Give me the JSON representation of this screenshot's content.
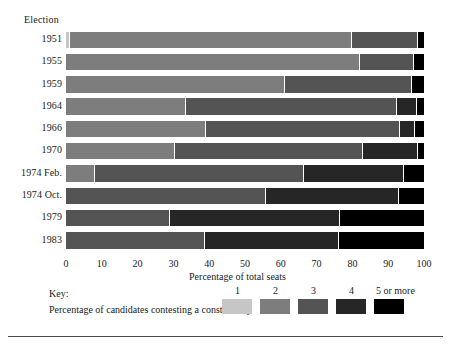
{
  "page": {
    "top_cut_text": "",
    "bottom_rule": true
  },
  "chart_data": {
    "type": "bar",
    "orientation": "horizontal",
    "stacked": true,
    "stack_mode": "percent",
    "title": "",
    "ylabel": "Election",
    "xlabel": "Percentage of total seats",
    "xlim": [
      0,
      100
    ],
    "xticks": [
      0,
      10,
      20,
      30,
      40,
      50,
      60,
      70,
      80,
      90,
      100
    ],
    "xtick_labels": [
      "0",
      "10",
      "20",
      "30",
      "40",
      "50",
      "60",
      "70",
      "80",
      "90",
      "100"
    ],
    "grid": false,
    "legend": {
      "title": "Key:",
      "subtitle": "Percentage of candidates contesting a constituency",
      "position": "bottom",
      "entries": [
        {
          "label": "1",
          "color": "#c6c6c6"
        },
        {
          "label": "2",
          "color": "#7d7d7d"
        },
        {
          "label": "3",
          "color": "#545454"
        },
        {
          "label": "4",
          "color": "#262626"
        },
        {
          "label": "5 or more",
          "color": "#000000"
        }
      ]
    },
    "categories": [
      "1951",
      "1955",
      "1959",
      "1964",
      "1966",
      "1970",
      "1974 Feb.",
      "1974 Oct.",
      "1979",
      "1983"
    ],
    "series": [
      {
        "name": "1",
        "values": [
          1.2,
          0,
          0,
          0,
          0,
          0,
          0,
          0,
          0,
          0
        ]
      },
      {
        "name": "2",
        "values": [
          78.7,
          82.1,
          61.2,
          33.5,
          39.1,
          30.4,
          8.1,
          0,
          0,
          0
        ]
      },
      {
        "name": "3",
        "values": [
          18.4,
          15.1,
          35.5,
          59.0,
          54.2,
          52.5,
          58.4,
          55.9,
          29.1,
          38.8
        ]
      },
      {
        "name": "4",
        "values": [
          0,
          0,
          0,
          5.6,
          4.2,
          15.4,
          27.9,
          37.2,
          47.5,
          37.4
        ]
      },
      {
        "name": "5 or more",
        "values": [
          1.7,
          2.8,
          3.3,
          1.9,
          2.5,
          1.7,
          5.6,
          6.9,
          23.4,
          23.8
        ]
      }
    ],
    "rows": [
      {
        "label": "1951",
        "segments": [
          {
            "series": "1",
            "value": 1.2
          },
          {
            "series": "2",
            "value": 78.7
          },
          {
            "series": "3",
            "value": 18.4
          },
          {
            "series": "5 or more",
            "value": 1.7
          }
        ]
      },
      {
        "label": "1955",
        "segments": [
          {
            "series": "2",
            "value": 82.1
          },
          {
            "series": "3",
            "value": 15.1
          },
          {
            "series": "5 or more",
            "value": 2.8
          }
        ]
      },
      {
        "label": "1959",
        "segments": [
          {
            "series": "2",
            "value": 61.2
          },
          {
            "series": "3",
            "value": 35.5
          },
          {
            "series": "5 or more",
            "value": 3.3
          }
        ]
      },
      {
        "label": "1964",
        "segments": [
          {
            "series": "2",
            "value": 33.5
          },
          {
            "series": "3",
            "value": 59.0
          },
          {
            "series": "4",
            "value": 5.6
          },
          {
            "series": "5 or more",
            "value": 1.9
          }
        ]
      },
      {
        "label": "1966",
        "segments": [
          {
            "series": "2",
            "value": 39.1
          },
          {
            "series": "3",
            "value": 54.2
          },
          {
            "series": "4",
            "value": 4.2
          },
          {
            "series": "5 or more",
            "value": 2.5
          }
        ]
      },
      {
        "label": "1970",
        "segments": [
          {
            "series": "2",
            "value": 30.4
          },
          {
            "series": "3",
            "value": 52.5
          },
          {
            "series": "4",
            "value": 15.4
          },
          {
            "series": "5 or more",
            "value": 1.7
          }
        ]
      },
      {
        "label": "1974 Feb.",
        "segments": [
          {
            "series": "2",
            "value": 8.1
          },
          {
            "series": "3",
            "value": 58.4
          },
          {
            "series": "4",
            "value": 27.9
          },
          {
            "series": "5 or more",
            "value": 5.6
          }
        ]
      },
      {
        "label": "1974 Oct.",
        "segments": [
          {
            "series": "3",
            "value": 55.9
          },
          {
            "series": "4",
            "value": 37.2
          },
          {
            "series": "5 or more",
            "value": 6.9
          }
        ]
      },
      {
        "label": "1979",
        "segments": [
          {
            "series": "3",
            "value": 29.1
          },
          {
            "series": "4",
            "value": 47.5
          },
          {
            "series": "5 or more",
            "value": 23.4
          }
        ]
      },
      {
        "label": "1983",
        "segments": [
          {
            "series": "3",
            "value": 38.8
          },
          {
            "series": "4",
            "value": 37.4
          },
          {
            "series": "5 or more",
            "value": 23.8
          }
        ]
      }
    ]
  }
}
